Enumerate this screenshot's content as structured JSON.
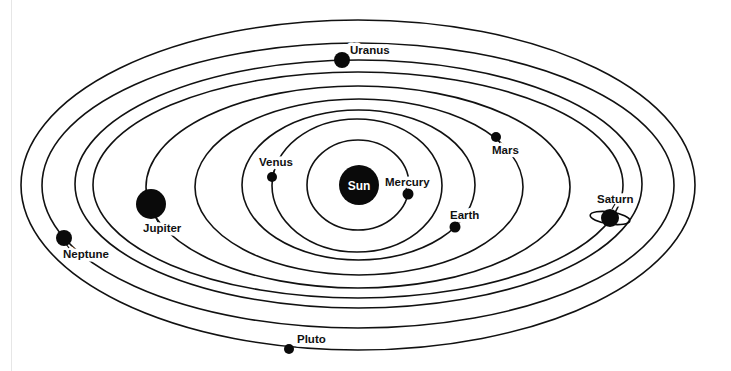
{
  "sun": {
    "label": "Sun"
  },
  "planets": [
    {
      "name": "mercury",
      "label": "Mercury"
    },
    {
      "name": "venus",
      "label": "Venus"
    },
    {
      "name": "earth",
      "label": "Earth"
    },
    {
      "name": "mars",
      "label": "Mars"
    },
    {
      "name": "jupiter",
      "label": "Jupiter"
    },
    {
      "name": "saturn",
      "label": "Saturn"
    },
    {
      "name": "uranus",
      "label": "Uranus"
    },
    {
      "name": "neptune",
      "label": "Neptune"
    },
    {
      "name": "pluto",
      "label": "Pluto"
    }
  ],
  "colors": {
    "ink": "#111111",
    "background": "#ffffff"
  }
}
